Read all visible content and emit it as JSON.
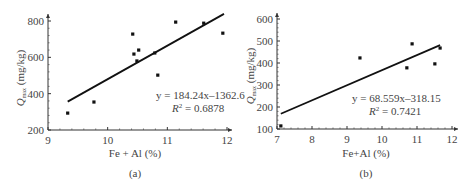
{
  "chart_data": [
    {
      "type": "scatter",
      "panel_label": "(a)",
      "xlabel": "Fe + Al (%)",
      "ylabel_main": "Q",
      "ylabel_sub": "max",
      "ylabel_unit": " (mg/kg)",
      "xlim": [
        9,
        12
      ],
      "ylim": [
        200,
        850
      ],
      "xticks": [
        9,
        10,
        11,
        12
      ],
      "yticks": [
        200,
        400,
        600,
        800
      ],
      "points": [
        {
          "x": 9.33,
          "y": 293
        },
        {
          "x": 9.77,
          "y": 354
        },
        {
          "x": 10.42,
          "y": 728
        },
        {
          "x": 10.44,
          "y": 618
        },
        {
          "x": 10.52,
          "y": 640
        },
        {
          "x": 10.49,
          "y": 580
        },
        {
          "x": 10.79,
          "y": 624
        },
        {
          "x": 10.84,
          "y": 502
        },
        {
          "x": 11.14,
          "y": 794
        },
        {
          "x": 11.61,
          "y": 788
        },
        {
          "x": 11.93,
          "y": 733
        }
      ],
      "fit": {
        "slope": 184.24,
        "intercept": -1362.6,
        "x_range": [
          9.33,
          11.95
        ]
      },
      "equation": "y = 184.24x–1362.6",
      "r2_label": "R",
      "r2_value": " = 0.6878",
      "grid": false
    },
    {
      "type": "scatter",
      "panel_label": "(b)",
      "xlabel": "Fe+Al (%)",
      "ylabel_main": "Q",
      "ylabel_sub": "max",
      "ylabel_unit": " (mg/kg)",
      "xlim": [
        7,
        12
      ],
      "ylim": [
        100,
        620
      ],
      "xticks": [
        7,
        8,
        9,
        10,
        11,
        12
      ],
      "yticks": [
        100,
        200,
        300,
        400,
        500,
        600
      ],
      "points": [
        {
          "x": 7.11,
          "y": 114
        },
        {
          "x": 9.37,
          "y": 423
        },
        {
          "x": 10.71,
          "y": 378
        },
        {
          "x": 10.86,
          "y": 487
        },
        {
          "x": 11.51,
          "y": 396
        },
        {
          "x": 11.66,
          "y": 468
        }
      ],
      "fit": {
        "slope": 68.559,
        "intercept": -318.15,
        "x_range": [
          7.11,
          11.66
        ]
      },
      "equation": "y = 68.559x–318.15",
      "r2_label": "R",
      "r2_value": " = 0.7421",
      "grid": false
    }
  ]
}
